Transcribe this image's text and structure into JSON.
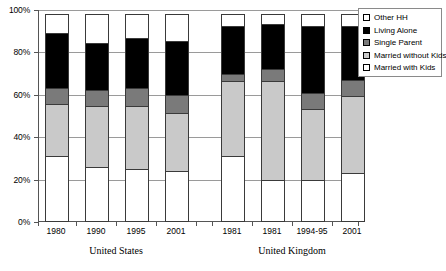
{
  "chart_data": {
    "type": "bar",
    "subtype": "stacked-percent",
    "title": "",
    "xlabel": "",
    "ylabel": "",
    "ylim": [
      0,
      100
    ],
    "ytick_labels": [
      "0%",
      "20%",
      "40%",
      "60%",
      "80%",
      "100%"
    ],
    "ytick_values": [
      0,
      20,
      40,
      60,
      80,
      100
    ],
    "grid": true,
    "legend_position": "right",
    "categories": [
      "1980",
      "1990",
      "1995",
      "2001",
      "1981",
      "1981",
      "1994-95",
      "2001"
    ],
    "groups": [
      {
        "label": "United States",
        "categories": [
          "1980",
          "1990",
          "1995",
          "2001"
        ]
      },
      {
        "label": "United Kingdom",
        "categories": [
          "1981",
          "1981",
          "1994-95",
          "2001"
        ]
      }
    ],
    "series": [
      {
        "name": "Married with Kids",
        "color": "#ffffff",
        "values": [
          31,
          26,
          25,
          24,
          31,
          20,
          20,
          23
        ]
      },
      {
        "name": "Married without Kids",
        "color": "#c9c9c9",
        "values": [
          25,
          29,
          30,
          28,
          36,
          47,
          34,
          37
        ]
      },
      {
        "name": "Single Parent",
        "color": "#7a7a7a",
        "values": [
          8,
          8,
          9,
          9,
          4,
          6,
          8,
          8
        ]
      },
      {
        "name": "Living Alone",
        "color": "#000000",
        "values": [
          26.5,
          23,
          24,
          26,
          23,
          22,
          32,
          26
        ]
      },
      {
        "name": "Other HH",
        "color": "#ffffff",
        "values": [
          9.5,
          14,
          12,
          13,
          6,
          5,
          6,
          6
        ]
      }
    ]
  },
  "legend": {
    "entries": [
      {
        "label": "Other HH",
        "swatch": "sw-other-hh"
      },
      {
        "label": "Living Alone",
        "swatch": "sw-living-alone"
      },
      {
        "label": "Single Parent",
        "swatch": "sw-single-parent"
      },
      {
        "label": "Married without Kids",
        "swatch": "sw-married-without-kids"
      },
      {
        "label": "Married with Kids",
        "swatch": "sw-married-with-kids"
      }
    ]
  }
}
